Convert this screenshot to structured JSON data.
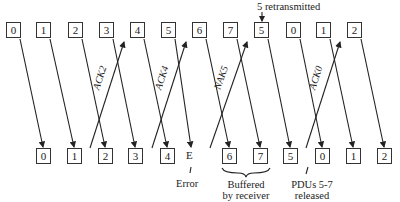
{
  "diagram": {
    "sender_frames": [
      "0",
      "1",
      "2",
      "3",
      "4",
      "5",
      "6",
      "7",
      "5",
      "0",
      "1",
      "2"
    ],
    "receiver_frames": [
      "0",
      "1",
      "2",
      "3",
      "4",
      "E",
      "6",
      "7",
      "5",
      "0",
      "1",
      "2"
    ],
    "acks": [
      {
        "label": "ACK2"
      },
      {
        "label": "ACK4"
      },
      {
        "label": "NAK5"
      },
      {
        "label": "ACK0"
      }
    ],
    "annotations": {
      "retransmitted": "5 retransmitted",
      "error": "Error",
      "buffered_line1": "Buffered",
      "buffered_line2": "by receiver",
      "released_line1": "PDUs 5-7",
      "released_line2": "released"
    }
  }
}
